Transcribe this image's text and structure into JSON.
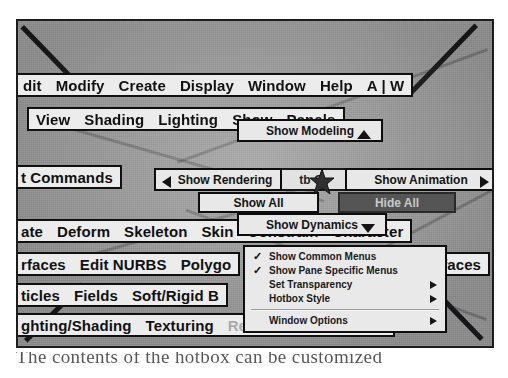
{
  "figure": {
    "app": "Maya Hotbox",
    "background_color": "#9a9a9a",
    "frame_border_color": "#1d1d1d"
  },
  "menu_rows": [
    {
      "name": "main-menu-row",
      "items": [
        "dit",
        "Modify",
        "Create",
        "Display",
        "Window",
        "Help",
        "A | W"
      ]
    },
    {
      "name": "panel-menu-row",
      "items": [
        "View",
        "Shading",
        "Lighting",
        "Show",
        "Panels"
      ]
    },
    {
      "name": "commands-row",
      "items": [
        "t Commands"
      ]
    },
    {
      "name": "animation-row",
      "items": [
        "ate",
        "Deform",
        "Skeleton",
        "Skin",
        "Constrain",
        "Character"
      ]
    },
    {
      "name": "modeling-row",
      "items": [
        "rfaces",
        "Edit NURBS",
        "Polygo"
      ]
    },
    {
      "name": "modeling-row-right",
      "items": [
        "urfaces"
      ]
    },
    {
      "name": "dynamics-row",
      "items": [
        "ticles",
        "Fields",
        "Soft/Rigid B"
      ]
    },
    {
      "name": "rendering-row",
      "items": [
        "ghting/Shading",
        "Texturing",
        "Render",
        "Paint Effects"
      ]
    }
  ],
  "radial": {
    "north": {
      "label": "Show Modeling",
      "arrow": "triangle-up"
    },
    "west": {
      "label": "Show Rendering",
      "arrow": "triangle-left"
    },
    "east": {
      "label": "Show Animation",
      "arrow": "triangle-right"
    },
    "south": {
      "label": "Show Dynamics",
      "arrow": "triangle-down"
    },
    "center": {
      "label": "tb    C"
    },
    "show_all": {
      "label": "Show All"
    },
    "hide_all": {
      "label": "Hide All",
      "state": "highlighted",
      "color": "#555555"
    }
  },
  "dropdown": {
    "name": "hotbox-options-menu",
    "items": [
      {
        "label": "Show Common Menus",
        "checked": true,
        "submenu": false
      },
      {
        "label": "Show Pane Specific Menus",
        "checked": true,
        "submenu": false
      },
      {
        "label": "Set Transparency",
        "checked": false,
        "submenu": true
      },
      {
        "label": "Hotbox Style",
        "checked": false,
        "submenu": true
      },
      {
        "separator": true
      },
      {
        "label": "Window Options",
        "checked": false,
        "submenu": true
      }
    ]
  },
  "caption": {
    "text": "The contents of the hotbox can be customized"
  }
}
